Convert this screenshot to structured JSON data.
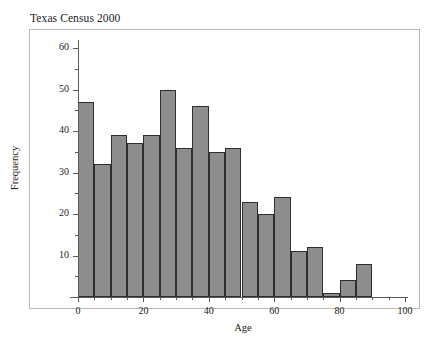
{
  "chart_data": {
    "type": "bar",
    "title": "Texas Census 2000",
    "xlabel": "Age",
    "ylabel": "Frequency",
    "xlim": [
      0,
      100
    ],
    "ylim": [
      0,
      62
    ],
    "bin_width": 5,
    "grid": false,
    "legend": null,
    "bar_fill_color": "#8d8d8d",
    "bar_edge_color": "#2e2e2e",
    "frame_color": "#b9b9b9",
    "axis_color": "#5a5a5a",
    "categories": [
      "0-5",
      "5-10",
      "10-15",
      "15-20",
      "20-25",
      "25-30",
      "30-35",
      "35-40",
      "40-45",
      "45-50",
      "50-55",
      "55-60",
      "60-65",
      "65-70",
      "70-75",
      "75-80",
      "80-85",
      "85-90"
    ],
    "bin_starts": [
      0,
      5,
      10,
      15,
      20,
      25,
      30,
      35,
      40,
      45,
      50,
      55,
      60,
      65,
      70,
      75,
      80,
      85
    ],
    "values": [
      47,
      32,
      39,
      37,
      39,
      50,
      36,
      46,
      35,
      36,
      23,
      20,
      24,
      11,
      12,
      1,
      4,
      8
    ],
    "xticks_major": [
      0,
      20,
      40,
      60,
      80,
      100
    ],
    "xticks_minor": [
      5,
      10,
      15,
      25,
      30,
      35,
      45,
      50,
      55,
      65,
      70,
      75,
      85,
      90,
      95
    ],
    "yticks_major": [
      10,
      20,
      30,
      40,
      50,
      60
    ],
    "yticks_minor": [
      5,
      15,
      25,
      35,
      45,
      55
    ],
    "xtick_labels": [
      "0",
      "20",
      "40",
      "60",
      "80",
      "100"
    ],
    "ytick_labels": [
      "10",
      "20",
      "30",
      "40",
      "50",
      "60"
    ]
  }
}
